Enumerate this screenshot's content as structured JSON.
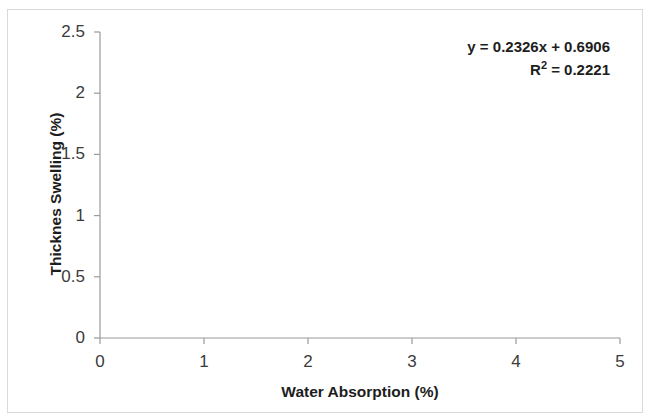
{
  "chart_data": {
    "type": "scatter",
    "title": "",
    "xlabel": "Water Absorption (%)",
    "ylabel": "Thicknes Swelling (%)",
    "xlim": [
      0,
      5
    ],
    "ylim": [
      0,
      2.5
    ],
    "xticks": [
      "0",
      "1",
      "2",
      "3",
      "4",
      "5"
    ],
    "yticks": [
      "0",
      "0.5",
      "1",
      "1.5",
      "2",
      "2.5"
    ],
    "xtick_values": [
      0,
      1,
      2,
      3,
      4,
      5
    ],
    "ytick_values": [
      0,
      0.5,
      1,
      1.5,
      2,
      2.5
    ],
    "grid": false,
    "legend": "none",
    "series": [
      {
        "name": "Thickness swelling vs water absorption",
        "marker": "diamond",
        "color": "#6b80c4",
        "points": [
          {
            "x": 1.0,
            "y": 1.0
          },
          {
            "x": 1.2,
            "y": 0.9
          },
          {
            "x": 1.5,
            "y": 0.7
          },
          {
            "x": 1.6,
            "y": 0.9
          },
          {
            "x": 2.0,
            "y": 2.0
          },
          {
            "x": 2.4,
            "y": 0.9
          },
          {
            "x": 2.6,
            "y": 0.9
          },
          {
            "x": 2.65,
            "y": 1.5
          },
          {
            "x": 3.0,
            "y": 1.8
          },
          {
            "x": 3.9,
            "y": 1.4
          }
        ]
      }
    ],
    "trendline": {
      "type": "linear",
      "slope": 0.2326,
      "intercept": 0.6906,
      "r_squared": 0.2221,
      "color": "#2b2b2b",
      "x_start": 1.0,
      "x_end": 4.08
    },
    "annotations": {
      "equation": "y = 0.2326x + 0.6906",
      "r_squared_prefix": "R",
      "r_squared_sup": "2",
      "r_squared_value": " = 0.2221"
    }
  },
  "axis_colors": {
    "axis_line": "#9a9a9a",
    "tick_label": "#3b3b3b",
    "axis_title": "#1d1d1d",
    "frame": "#d9d9d9"
  }
}
